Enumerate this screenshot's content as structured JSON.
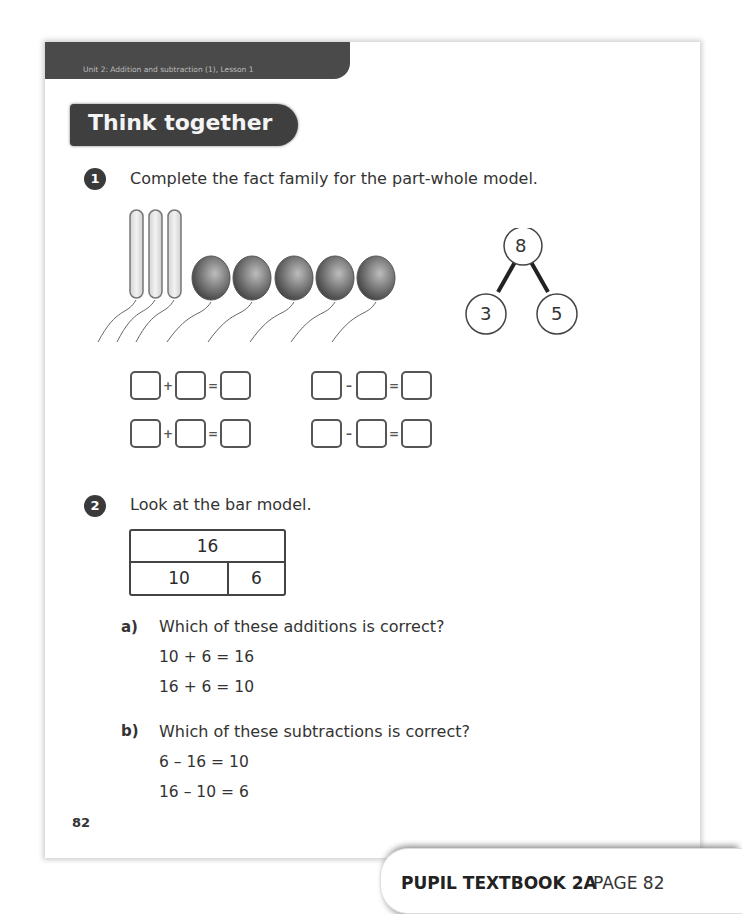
{
  "header": {
    "unit_label": "Unit 2: Addition and subtraction (1), Lesson 1",
    "section_title": "Think together"
  },
  "question1": {
    "number": "1",
    "prompt": "Complete the fact family for the part-whole model.",
    "balloons": {
      "long_count": 3,
      "round_count": 5
    },
    "part_whole": {
      "whole": "8",
      "part_left": "3",
      "part_right": "5"
    },
    "equations": [
      {
        "op1": "+",
        "op2": "="
      },
      {
        "op1": "–",
        "op2": "="
      },
      {
        "op1": "+",
        "op2": "="
      },
      {
        "op1": "–",
        "op2": "="
      }
    ]
  },
  "question2": {
    "number": "2",
    "prompt": "Look at the bar model.",
    "bar_model": {
      "whole": "16",
      "part_left": "10",
      "part_right": "6"
    },
    "part_a": {
      "label": "a)",
      "prompt": "Which of these additions is correct?",
      "options": [
        "10 + 6 = 16",
        "16 + 6 = 10"
      ]
    },
    "part_b": {
      "label": "b)",
      "prompt": "Which of these subtractions is correct?",
      "options": [
        "6 – 16 = 10",
        "16 – 10 = 6"
      ]
    }
  },
  "page_number": "82",
  "footer": {
    "book": "PUPIL TEXTBOOK 2A",
    "page": "PAGE 82"
  }
}
